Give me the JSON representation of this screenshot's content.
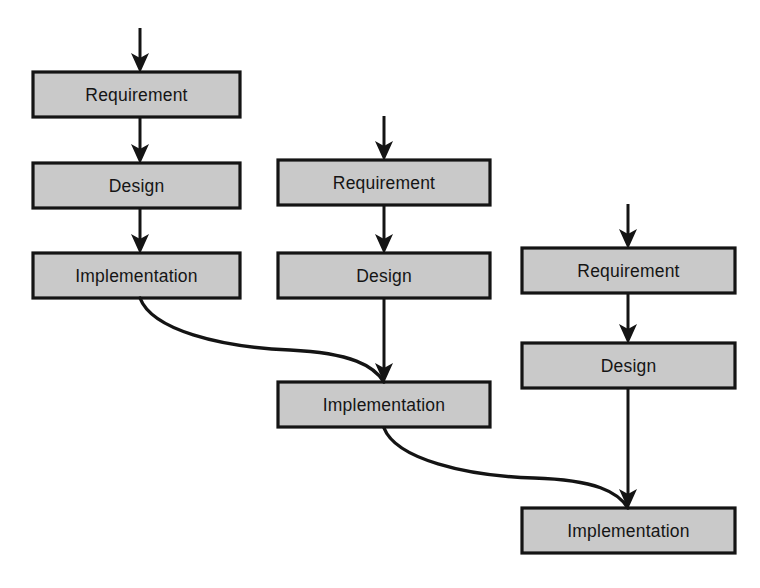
{
  "diagram": {
    "type": "flow-diagram",
    "background_color": "#ffffff",
    "box_fill_color": "#c9c9c9",
    "box_border_color": "#141414",
    "connector_color": "#141414",
    "cycles": [
      {
        "id": "cycle-1",
        "name": "Iteration 1",
        "stages": [
          {
            "id": "c1-requirement",
            "label": "Requirement",
            "x": 33,
            "y": 72,
            "w": 207,
            "h": 45
          },
          {
            "id": "c1-design",
            "label": "Design",
            "x": 33,
            "y": 163,
            "w": 207,
            "h": 45
          },
          {
            "id": "c1-implementation",
            "label": "Implementation",
            "x": 33,
            "y": 253,
            "w": 207,
            "h": 45
          }
        ],
        "entry_arrow": {
          "x": 140,
          "y_start": 28,
          "y_end": 72
        },
        "internal_arrows": [
          {
            "from": "c1-requirement",
            "to": "c1-design",
            "x": 140,
            "y_start": 117,
            "y_end": 163
          },
          {
            "from": "c1-design",
            "to": "c1-implementation",
            "x": 140,
            "y_start": 208,
            "y_end": 253
          }
        ]
      },
      {
        "id": "cycle-2",
        "name": "Iteration 2",
        "stages": [
          {
            "id": "c2-requirement",
            "label": "Requirement",
            "x": 278,
            "y": 160,
            "w": 212,
            "h": 45
          },
          {
            "id": "c2-design",
            "label": "Design",
            "x": 278,
            "y": 253,
            "w": 212,
            "h": 45
          },
          {
            "id": "c2-implementation",
            "label": "Implementation",
            "x": 278,
            "y": 382,
            "w": 212,
            "h": 45
          }
        ],
        "entry_arrow": {
          "x": 384,
          "y_start": 116,
          "y_end": 160
        },
        "internal_arrows": [
          {
            "from": "c2-requirement",
            "to": "c2-design",
            "x": 384,
            "y_start": 205,
            "y_end": 253
          },
          {
            "from": "c2-design",
            "to": "c2-implementation",
            "x": 384,
            "y_start": 298,
            "y_end": 382
          }
        ]
      },
      {
        "id": "cycle-3",
        "name": "Iteration 3",
        "stages": [
          {
            "id": "c3-requirement",
            "label": "Requirement",
            "x": 522,
            "y": 248,
            "w": 213,
            "h": 45
          },
          {
            "id": "c3-design",
            "label": "Design",
            "x": 522,
            "y": 343,
            "w": 213,
            "h": 45
          },
          {
            "id": "c3-implementation",
            "label": "Implementation",
            "x": 522,
            "y": 508,
            "w": 213,
            "h": 45
          }
        ],
        "entry_arrow": {
          "x": 628,
          "y_start": 204,
          "y_end": 248
        },
        "internal_arrows": [
          {
            "from": "c3-requirement",
            "to": "c3-design",
            "x": 628,
            "y_start": 293,
            "y_end": 343
          },
          {
            "from": "c3-design",
            "to": "c3-implementation",
            "x": 628,
            "y_start": 388,
            "y_end": 508
          }
        ]
      }
    ],
    "cross_cycle_connectors": [
      {
        "id": "connector-1-to-2",
        "from": "c1-implementation",
        "to": "c2-implementation",
        "path": "M 140 298 C 152 330, 220 347, 290 350 C 352 353, 374 366, 384 382"
      },
      {
        "id": "connector-2-to-3",
        "from": "c2-implementation",
        "to": "c3-implementation",
        "path": "M 384 428 C 396 459, 466 476, 534 478 C 596 480, 618 492, 628 508"
      }
    ]
  }
}
